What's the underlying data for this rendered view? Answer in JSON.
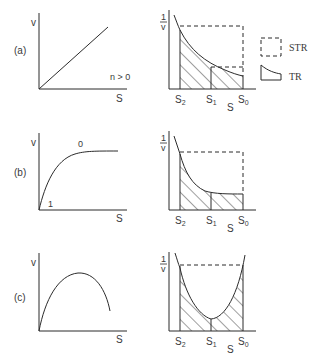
{
  "figure": {
    "panels": [
      {
        "id": "a",
        "label": "(a)",
        "left_plot": {
          "y_label": "v",
          "x_label": "S",
          "curve": "linear",
          "annotation": "n > 0"
        },
        "right_plot": {
          "y_label_num": "1",
          "y_label_den": "v",
          "x_label": "S",
          "ticks": [
            "S",
            "S",
            "S"
          ],
          "tick_subs": [
            "2",
            "1",
            "0"
          ]
        }
      },
      {
        "id": "b",
        "label": "(b)",
        "left_plot": {
          "y_label": "v",
          "x_label": "S",
          "curve": "saturating",
          "annotation_high": "0",
          "annotation_low": "1"
        },
        "right_plot": {
          "y_label_num": "1",
          "y_label_den": "v",
          "x_label": "S",
          "ticks": [
            "S",
            "S",
            "S"
          ],
          "tick_subs": [
            "2",
            "1",
            "0"
          ]
        }
      },
      {
        "id": "c",
        "label": "(c)",
        "left_plot": {
          "y_label": "v",
          "x_label": "S",
          "curve": "maximum"
        },
        "right_plot": {
          "y_label_num": "1",
          "y_label_den": "v",
          "x_label": "S",
          "ticks": [
            "S",
            "S",
            "S"
          ],
          "tick_subs": [
            "2",
            "1",
            "0"
          ]
        }
      }
    ],
    "legend": [
      {
        "symbol": "dashed-box",
        "label": "STR"
      },
      {
        "symbol": "tubular-shape",
        "label": "TR"
      }
    ],
    "colors": {
      "line": "#2b2b2b",
      "text": "#3a3a3a",
      "background": "#ffffff"
    }
  }
}
